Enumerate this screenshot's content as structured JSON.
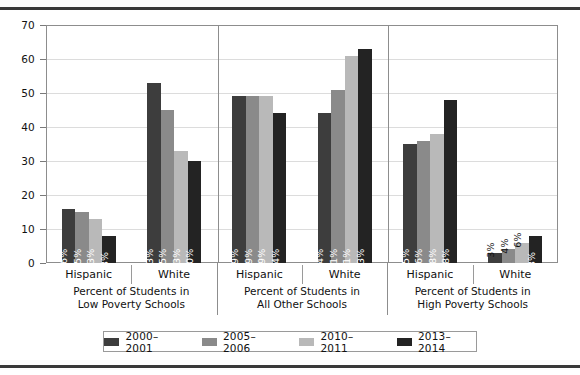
{
  "chart_data": {
    "type": "bar",
    "title": "",
    "xlabel": "",
    "ylabel": "",
    "ylim": [
      0,
      70
    ],
    "yticks": [
      0,
      10,
      20,
      30,
      40,
      50,
      60,
      70
    ],
    "grid": true,
    "legend_position": "bottom",
    "value_suffix": "%",
    "categories": [
      "Hispanic",
      "White",
      "Hispanic",
      "White",
      "Hispanic",
      "White"
    ],
    "groups": [
      {
        "title_line1": "Percent of Students in",
        "title_line2": "Low Poverty Schools",
        "categories": [
          "Hispanic",
          "White"
        ]
      },
      {
        "title_line1": "Percent of Students in",
        "title_line2": "All Other Schools",
        "categories": [
          "Hispanic",
          "White"
        ]
      },
      {
        "title_line1": "Percent of Students in",
        "title_line2": "High Poverty Schools",
        "categories": [
          "Hispanic",
          "White"
        ]
      }
    ],
    "series": [
      {
        "name": "2000–2001",
        "color": "#3d3d3d",
        "values": [
          16,
          53,
          49,
          44,
          35,
          3
        ],
        "labels": [
          "16%",
          "53%",
          "49%",
          "44%",
          "35%",
          "3%"
        ]
      },
      {
        "name": "2005–2006",
        "color": "#8a8a8a",
        "values": [
          15,
          45,
          49,
          51,
          36,
          4
        ],
        "labels": [
          "15%",
          "45%",
          "49%",
          "51%",
          "36%",
          "4%"
        ]
      },
      {
        "name": "2010–2011",
        "color": "#b9b9b9",
        "values": [
          13,
          33,
          49,
          61,
          38,
          6
        ],
        "labels": [
          "13%",
          "33%",
          "49%",
          "61%",
          "38%",
          "6%"
        ]
      },
      {
        "name": "2013–2014",
        "color": "#232323",
        "values": [
          8,
          30,
          44,
          63,
          48,
          8
        ],
        "labels": [
          "8%",
          "30%",
          "44%",
          "63%",
          "48%",
          "8%"
        ]
      }
    ]
  },
  "legend": {
    "items": [
      {
        "label": "2000–2001",
        "color": "#3d3d3d"
      },
      {
        "label": "2005–2006",
        "color": "#8a8a8a"
      },
      {
        "label": "2010–2011",
        "color": "#b9b9b9"
      },
      {
        "label": "2013–2014",
        "color": "#232323"
      }
    ]
  }
}
